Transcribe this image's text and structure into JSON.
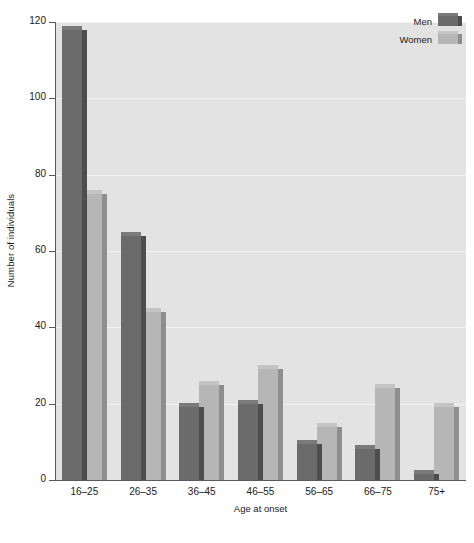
{
  "chart_data": {
    "type": "bar",
    "title": "",
    "xlabel": "Age at onset",
    "ylabel": "Number of individuals",
    "categories": [
      "16–25",
      "26–35",
      "36–45",
      "46–55",
      "56–65",
      "66–75",
      "75+"
    ],
    "series": [
      {
        "name": "Men",
        "color": "#6b6b6b",
        "values": [
          118,
          64,
          19,
          20,
          9.5,
          8,
          1.5
        ]
      },
      {
        "name": "Women",
        "color": "#b6b6b6",
        "values": [
          75,
          44,
          25,
          29,
          14,
          24,
          19
        ]
      }
    ],
    "ylim": [
      0,
      120
    ],
    "yticks": [
      0,
      20,
      40,
      60,
      80,
      100,
      120
    ],
    "ytick_labels": [
      "0",
      "20",
      "40",
      "60",
      "80",
      "100",
      "120"
    ],
    "grid": true,
    "grid_axis": "y",
    "legend_position": "top-right",
    "plot_background": "#e3e3e3",
    "figure_background": "#ffffff",
    "gridline_color": "#f4f4f4",
    "axis_color": "#5a5a5a",
    "style": "3d-bars"
  }
}
